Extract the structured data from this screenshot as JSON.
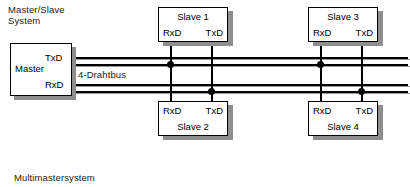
{
  "diagram": {
    "title_top": "Master/Slave\nSystem",
    "title_bottom": "Multimastersystem",
    "bus_label": "4-Drahtbus",
    "master": {
      "name": "Master",
      "tx_port": "TxD",
      "rx_port": "RxD"
    },
    "slaves": [
      {
        "name": "Slave 1",
        "rx_port": "RxD",
        "tx_port": "TxD"
      },
      {
        "name": "Slave 2",
        "rx_port": "RxD",
        "tx_port": "TxD"
      },
      {
        "name": "Slave 3",
        "rx_port": "RxD",
        "tx_port": "TxD"
      },
      {
        "name": "Slave 4",
        "rx_port": "RxD",
        "tx_port": "TxD"
      }
    ],
    "colors": {
      "line": "#000000",
      "shadow": "#8e8e8e",
      "background": "#ffffff",
      "text": "#1a1a1a"
    }
  }
}
